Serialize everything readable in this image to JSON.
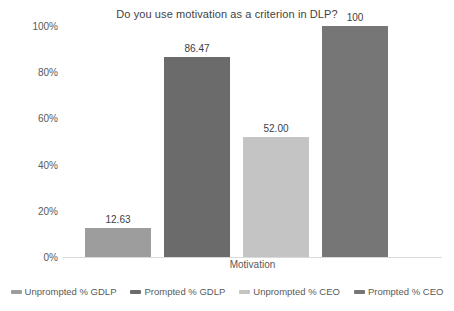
{
  "chart_data": {
    "type": "bar",
    "title": "Do you use motivation as a criterion in DLP?",
    "xlabel": "Motivation",
    "ylabel": "",
    "categories": [
      "Motivation"
    ],
    "ylim": [
      0,
      100
    ],
    "yticks": [
      "0%",
      "20%",
      "40%",
      "60%",
      "80%",
      "100%"
    ],
    "ytick_values": [
      0,
      20,
      40,
      60,
      80,
      100
    ],
    "grid": false,
    "legend_position": "bottom",
    "series": [
      {
        "name": "Unprompted % GDLP",
        "values": [
          12.63
        ],
        "label": "12.63",
        "color": "#9d9d9d"
      },
      {
        "name": "Prompted % GDLP",
        "values": [
          86.47
        ],
        "label": "86.47",
        "color": "#6b6b6b"
      },
      {
        "name": "Unprompted % CEO",
        "values": [
          52.0
        ],
        "label": "52.00",
        "color": "#c4c4c4"
      },
      {
        "name": "Prompted % CEO",
        "values": [
          100
        ],
        "label": "100",
        "color": "#767676"
      }
    ]
  }
}
